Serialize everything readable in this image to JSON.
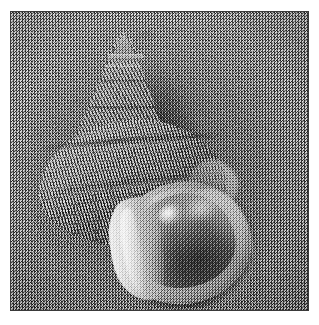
{
  "image": {
    "domain": "Natural-Image",
    "subject": "seashell",
    "caption": "Grayscale close-up photograph of a pointed marine snail shell resting on a grainy sand surface",
    "color_mode": "grayscale",
    "noise": "heavy film grain / salt-and-pepper speckle",
    "frame": {
      "border_color": "#3a3a3a",
      "margin_color": "#ffffff",
      "photo_left": 10,
      "photo_top": 11,
      "photo_width": 299,
      "photo_height": 300
    },
    "palette": {
      "background_gray": "#878787",
      "shell_midtone": "#8a8a8a",
      "shell_highlight": "#f2f2f2",
      "shell_shadow": "#3b3b3b",
      "aperture_interior": "#4a4a4a",
      "outline_dark": "#1c1c1c"
    },
    "parts": [
      {
        "name": "apex",
        "label": "Apex (tip of spire)",
        "approx_x": 157,
        "approx_y": 40
      },
      {
        "name": "spire",
        "label": "Conical spire with horizontal suture bands"
      },
      {
        "name": "body-whorl",
        "label": "Body whorl with zigzag vermiculated pattern"
      },
      {
        "name": "suture",
        "label": "Suture groove between whorls"
      },
      {
        "name": "aperture",
        "label": "Oval aperture opening",
        "approx_x": 178,
        "approx_y": 232
      },
      {
        "name": "columella",
        "label": "Bright columella / inner lip"
      },
      {
        "name": "outer-lip",
        "label": "Outer lip rim highlight"
      },
      {
        "name": "shadow",
        "label": "Cast shadow halo on sand"
      }
    ],
    "lighting": {
      "key_light_direction": "upper-left",
      "highlight_spot_x": 160,
      "highlight_spot_y": 204
    }
  }
}
